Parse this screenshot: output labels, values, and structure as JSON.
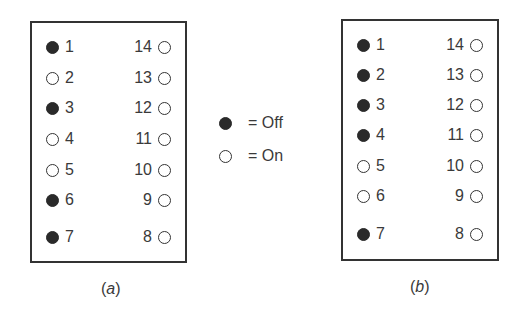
{
  "legend": {
    "off": {
      "symbol": "filled-circle",
      "label": "= Off"
    },
    "on": {
      "symbol": "open-circle",
      "label": "= On"
    }
  },
  "panels": [
    {
      "id": "a",
      "caption": "a",
      "left_switches": [
        {
          "number": "1",
          "state": "off"
        },
        {
          "number": "2",
          "state": "on"
        },
        {
          "number": "3",
          "state": "off"
        },
        {
          "number": "4",
          "state": "on"
        },
        {
          "number": "5",
          "state": "on"
        },
        {
          "number": "6",
          "state": "off"
        },
        {
          "number": "7",
          "state": "off"
        }
      ],
      "right_switches": [
        {
          "number": "14",
          "state": "on"
        },
        {
          "number": "13",
          "state": "on"
        },
        {
          "number": "12",
          "state": "on"
        },
        {
          "number": "11",
          "state": "on"
        },
        {
          "number": "10",
          "state": "on"
        },
        {
          "number": "9",
          "state": "on"
        },
        {
          "number": "8",
          "state": "on"
        }
      ]
    },
    {
      "id": "b",
      "caption": "b",
      "left_switches": [
        {
          "number": "1",
          "state": "off"
        },
        {
          "number": "2",
          "state": "off"
        },
        {
          "number": "3",
          "state": "off"
        },
        {
          "number": "4",
          "state": "off"
        },
        {
          "number": "5",
          "state": "on"
        },
        {
          "number": "6",
          "state": "on"
        },
        {
          "number": "7",
          "state": "off"
        }
      ],
      "right_switches": [
        {
          "number": "14",
          "state": "on"
        },
        {
          "number": "13",
          "state": "on"
        },
        {
          "number": "12",
          "state": "on"
        },
        {
          "number": "11",
          "state": "on"
        },
        {
          "number": "10",
          "state": "on"
        },
        {
          "number": "9",
          "state": "on"
        },
        {
          "number": "8",
          "state": "on"
        }
      ]
    }
  ]
}
